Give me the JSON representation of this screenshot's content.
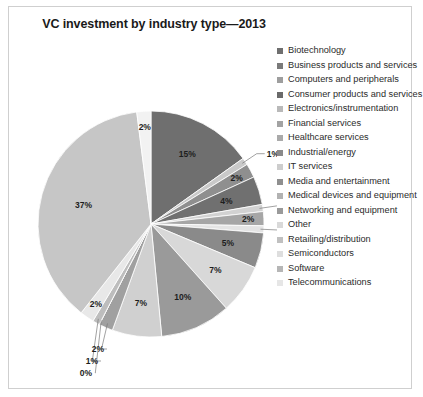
{
  "chart_data": {
    "type": "pie",
    "title": "VC investment by industry type—2013",
    "xlabel": "",
    "ylabel": "",
    "legend_position": "right",
    "grid": false,
    "units": "percent",
    "categories": [
      "Biotechnology",
      "Business products and services",
      "Computers and peripherals",
      "Consumer products and services",
      "Electronics/instrumentation",
      "Financial services",
      "Healthcare services",
      "Industrial/energy",
      "IT services",
      "Media and entertainment",
      "Medical devices and equipment",
      "Networking and equipment",
      "Other",
      "Retailing/distribution",
      "Semiconductors",
      "Software",
      "Telecommunications"
    ],
    "values": [
      15,
      1,
      2,
      4,
      1,
      2,
      1,
      5,
      7,
      10,
      7,
      2,
      0,
      1,
      2,
      37,
      2
    ],
    "data_labels": [
      "15%",
      "1%",
      "2%",
      "4%",
      "1%",
      "2%",
      "1%",
      "5%",
      "7%",
      "10%",
      "7%",
      "2%",
      "0%",
      "1%",
      "2%",
      "37%",
      "2%"
    ],
    "colors": [
      "#6f6f6f",
      "#c9c9c9",
      "#8f8f8f",
      "#707070",
      "#d2d2d2",
      "#a6a6a6",
      "#e4e4e4",
      "#8a8a8a",
      "#d8d8d8",
      "#9a9a9a",
      "#d0d0d0",
      "#a0a0a0",
      "#efefef",
      "#bdbdbd",
      "#e8e8e8",
      "#c6c6c6",
      "#f2f2f2"
    ],
    "legend_swatch_colors": [
      "#6f6f6f",
      "#7a7a7a",
      "#9e9e9e",
      "#6a6a6a",
      "#b9b9b9",
      "#a3a3a3",
      "#aaaaaa",
      "#8a8a8a",
      "#cdcdcd",
      "#8f8f8f",
      "#b2b2b2",
      "#9a9a9a",
      "#d9d9d9",
      "#c0c0c0",
      "#dedede",
      "#b6b6b6",
      "#e6e6e6"
    ]
  }
}
